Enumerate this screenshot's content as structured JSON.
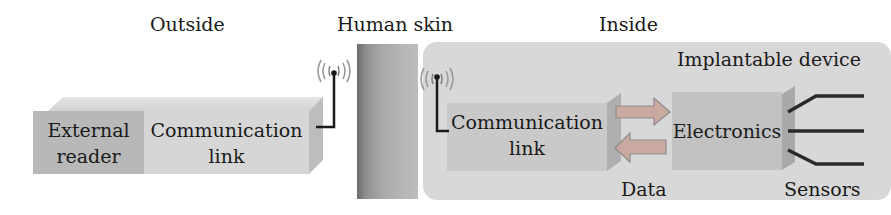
{
  "regions": {
    "outside": "Outside",
    "skin": "Human skin",
    "inside": "Inside"
  },
  "outside_block": {
    "reader": [
      "External",
      "reader"
    ],
    "comm": [
      "Communication",
      "link"
    ]
  },
  "inside_block": {
    "title": "Implantable device",
    "comm": [
      "Communication",
      "link"
    ],
    "electronics": "Electronics",
    "data_label": "Data",
    "sensors_label": "Sensors"
  },
  "icons": [
    "antenna-icon",
    "antenna-icon",
    "arrow-right-icon",
    "arrow-left-icon",
    "sensor-lead-icon"
  ],
  "colors": {
    "reader": "#b8b8b8",
    "comm": "#d6d6d6",
    "skin_dark": "#6b6b6b",
    "inside_panel": "#d8d8d8",
    "electronics": "#c2c2c2",
    "wire": "#1a1a1a"
  }
}
